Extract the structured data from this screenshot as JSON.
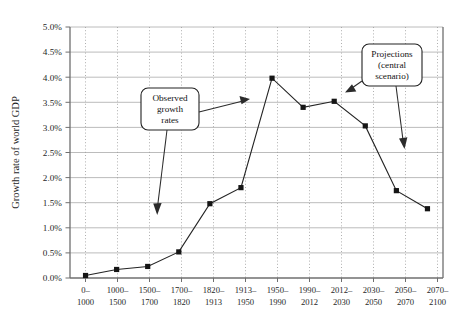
{
  "chart_data": {
    "type": "line",
    "title": "",
    "subtitle": "",
    "xlabel": "",
    "ylabel": "Growth rate of world GDP",
    "ylim": [
      0.0,
      5.0
    ],
    "yticks": [
      "0.0%",
      "0.5%",
      "1.0%",
      "1.5%",
      "2.0%",
      "2.5%",
      "3.0%",
      "3.5%",
      "4.0%",
      "4.5%",
      "5.0%"
    ],
    "ytick_values": [
      0.0,
      0.5,
      1.0,
      1.5,
      2.0,
      2.5,
      3.0,
      3.5,
      4.0,
      4.5,
      5.0
    ],
    "grid": "horizontal solid gridlines and vertical dotted gridlines",
    "legend": "none",
    "categories": [
      "0–\n1000",
      "1000–\n1500",
      "1500–\n1700",
      "1700–\n1820",
      "1820–\n1913",
      "1913–\n1950",
      "1950–\n1990",
      "1990–\n2012",
      "2012–\n2030",
      "2030–\n2050",
      "2050–\n2070",
      "2070–\n2100"
    ],
    "categories_line1": [
      "0–",
      "1000–",
      "1500–",
      "1700–",
      "1820–",
      "1913–",
      "1950–",
      "1990–",
      "2012–",
      "2030–",
      "2050–",
      "2070–"
    ],
    "categories_line2": [
      "1000",
      "1500",
      "1700",
      "1820",
      "1913",
      "1950",
      "1990",
      "2012",
      "2030",
      "2050",
      "2070",
      "2100"
    ],
    "values": [
      0.05,
      0.17,
      0.23,
      0.52,
      1.48,
      1.8,
      3.98,
      3.4,
      3.52,
      3.03,
      1.74,
      1.38
    ],
    "series": [
      {
        "name": "Growth rate of world GDP",
        "values": [
          0.05,
          0.17,
          0.23,
          0.52,
          1.48,
          1.8,
          3.98,
          3.4,
          3.52,
          3.03,
          1.74,
          1.38
        ]
      }
    ],
    "annotations": [
      {
        "id": "observed",
        "lines": [
          "Observed",
          "growth",
          "rates"
        ],
        "arrows": 2
      },
      {
        "id": "projections",
        "lines": [
          "Projections",
          "(central",
          "scenario)"
        ],
        "arrows": 2
      }
    ],
    "colors": {
      "line": "#242424",
      "marker": "#151515",
      "hgrid": "#b4b4b4",
      "vgrid": "#9a9a9a",
      "axis": "#6f6f6f",
      "background": "#ffffff"
    }
  },
  "annotation_observed": {
    "line1": "Observed",
    "line2": "growth",
    "line3": "rates"
  },
  "annotation_projections": {
    "line1": "Projections",
    "line2": "(central",
    "line3": "scenario)"
  }
}
